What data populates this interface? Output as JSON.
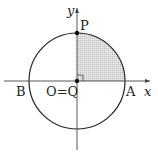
{
  "diagram": {
    "type": "unit-circle-quadrant",
    "axes": {
      "x_label": "x",
      "y_label": "y"
    },
    "points": {
      "P": "P",
      "A": "A",
      "B": "B",
      "origin": "O=Q"
    },
    "shaded_region": "first quadrant sector between OP and OA",
    "right_angle_marker": true,
    "colors": {
      "stroke": "#222222",
      "shade": "#d6d6d6"
    }
  }
}
